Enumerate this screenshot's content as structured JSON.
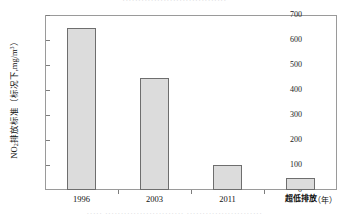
{
  "page": {
    "clipped_top_text": "·································",
    "clipped_bottom_text": "·····   ·························   ························"
  },
  "chart_data": {
    "type": "bar",
    "title": "",
    "categories": [
      "1996",
      "2003",
      "2011",
      "超低排放"
    ],
    "values": [
      650,
      450,
      100,
      50
    ],
    "xlabel": "（年）",
    "ylabel": "NO₂排放标准（标况下,mg/m³）",
    "ylabel_parts": {
      "species": "NO",
      "species_sub": "2",
      "text_main": "排放标准（标况下,mg/m",
      "unit_sup": "3",
      "text_tail": "）"
    },
    "ylim": [
      0,
      700
    ],
    "yticks": [
      0,
      100,
      200,
      300,
      400,
      500,
      600,
      700
    ],
    "ytick_labels": [
      "0",
      "100",
      "200",
      "300",
      "400",
      "500",
      "600",
      "700"
    ],
    "grid": false,
    "legend": null,
    "bar_fill_color": "#dcdcdc",
    "bar_border_color": "#6e6e6e",
    "axis_color": "#9a9a9a"
  }
}
